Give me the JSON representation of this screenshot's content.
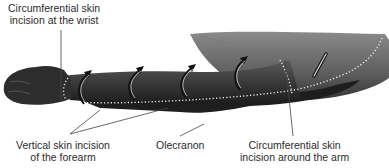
{
  "figure": {
    "colors": {
      "skin_dark": "#2b2b2b",
      "skin_mid": "#555555",
      "skin_light": "#8a8a8a",
      "incision_dots": "#f2f2f2",
      "leader_line": "#444444"
    },
    "labels": {
      "wrist": {
        "line1": "Circumferential skin",
        "line2": "incision at the wrist"
      },
      "forearm": {
        "line1": "Vertical skin incision",
        "line2": "of the forearm"
      },
      "olecranon": {
        "line1": "Olecranon"
      },
      "arm": {
        "line1": "Circumferential skin",
        "line2": "incision around the arm"
      }
    },
    "arrows": {
      "count": 4,
      "meaning": "skin flap reflection direction"
    }
  }
}
